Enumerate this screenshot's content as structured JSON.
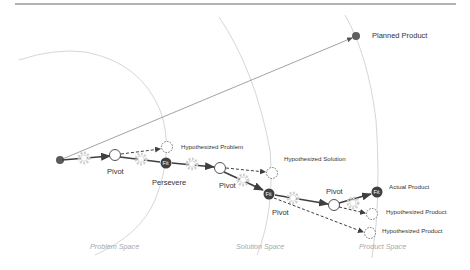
{
  "diagram": {
    "colors": {
      "node_dark": "#3f3f3f",
      "start_dot": "#5a5a5a",
      "arc": "#c8c8c8",
      "gear": "#d0d0d0",
      "space_label": "#a8a8a8",
      "top_rule": "#9a9a9a"
    },
    "spaces": {
      "problem": "Problem Space",
      "solution": "Solution Space",
      "product": "Product Space"
    },
    "labels": {
      "planned_product": "Planned Product",
      "hypothesized_problem": "Hypothesized Problem",
      "hypothesized_solution": "Hypothesized Solution",
      "actual_product": "Actual Product",
      "hypothesized_product_1": "Hypothesized Product",
      "hypothesized_product_2": "Hypothesized Product",
      "pivot_1": "Pivot",
      "persevere": "Persevere",
      "pivot_2": "Pivot",
      "pivot_3": "Pivot",
      "pivot_4": "Pivot"
    },
    "fit_nodes": [
      {
        "label": "Fit"
      },
      {
        "label": "Fit"
      },
      {
        "label": "Fit"
      }
    ],
    "icons": {
      "gear": "gear-icon",
      "start": "start-dot",
      "pivot_node": "circle-node",
      "hypothesis_node": "dashed-circle-node",
      "fit_node": "fit-node"
    }
  }
}
